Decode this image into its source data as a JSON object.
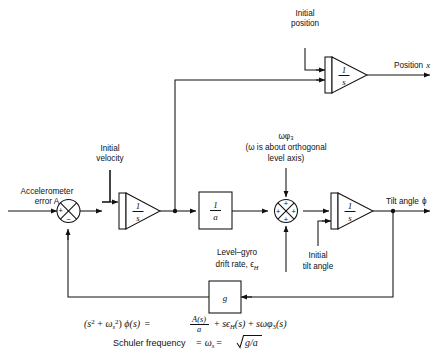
{
  "diagram": {
    "inputs": {
      "accelerometer_error": "Accelerometer",
      "accelerometer_error_2": "error A",
      "initial_velocity_1": "Initial",
      "initial_velocity_2": "velocity",
      "initial_position_1": "Initial",
      "initial_position_2": "position",
      "initial_tilt_1": "Initial",
      "initial_tilt_2": "tilt angle",
      "omega_phi3": "ωφ₃",
      "omega_note_1": "(ω is about orthogonal",
      "omega_note_2": "level axis)",
      "level_gyro_1": "Level–gyro",
      "level_gyro_2": "drift rate, ϵ",
      "level_gyro_2_sub": "H"
    },
    "outputs": {
      "position": "Position x",
      "position_label": "Position",
      "position_var": "x",
      "tilt": "Tilt angle ϕ",
      "tilt_label": "Tilt angle",
      "tilt_var": "ϕ"
    },
    "blocks": [
      {
        "id": "integrator-velocity",
        "type": "integrator",
        "numerator": "1",
        "denominator": "s"
      },
      {
        "id": "integrator-position",
        "type": "integrator",
        "numerator": "1",
        "denominator": "s"
      },
      {
        "id": "integrator-tilt",
        "type": "integrator",
        "numerator": "1",
        "denominator": "s"
      },
      {
        "id": "gain-inverse-a",
        "type": "box",
        "numerator": "1",
        "denominator": "a"
      },
      {
        "id": "gain-g",
        "type": "box",
        "label": "g"
      }
    ],
    "summers": [
      {
        "id": "summer-acceleration",
        "signs": {
          "left": "+",
          "bottom": "−"
        }
      },
      {
        "id": "summer-tilt-rate",
        "signs": {
          "left": "+",
          "top": "+",
          "bottom": "+",
          "right": "+"
        }
      }
    ],
    "equations": {
      "transfer_line": "(s² + ωₛ²) ϕ(s) = A(s)/a + sϵₕ(s) + sωφ₃(s)",
      "schuler_line": "Schuler frequency = ωₛ = √(g/a)",
      "schuler_prefix": "Schuler frequency",
      "schuler_eq1": "=",
      "schuler_omega": "ω",
      "schuler_omega_sub": "s",
      "schuler_eq2": "=",
      "schuler_radicand": "g/a"
    },
    "colors": {
      "ink": "#111111",
      "background": "#ffffff"
    }
  }
}
